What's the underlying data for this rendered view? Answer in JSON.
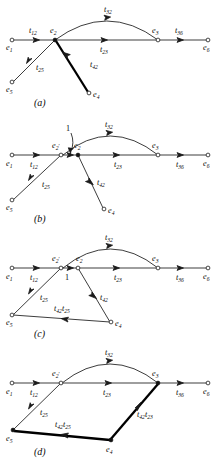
{
  "figure": {
    "panels": [
      {
        "id": "a",
        "caption": "(a)",
        "nodes": [
          {
            "name": "e1",
            "label": "e",
            "sub": "1"
          },
          {
            "name": "e2",
            "label": "e",
            "sub": "2"
          },
          {
            "name": "e3",
            "label": "e",
            "sub": "3"
          },
          {
            "name": "e4",
            "label": "e",
            "sub": "4"
          },
          {
            "name": "e5",
            "label": "e",
            "sub": "5"
          },
          {
            "name": "e6",
            "label": "e",
            "sub": "6"
          }
        ],
        "edges": [
          {
            "name": "e1-e2",
            "label": "t",
            "sub": "12",
            "bold": false
          },
          {
            "name": "e2-e3",
            "label": "t",
            "sub": "23",
            "bold": false
          },
          {
            "name": "e3-e6",
            "label": "t",
            "sub": "36",
            "bold": false
          },
          {
            "name": "e2-e3-arc",
            "label": "t",
            "sub": "32",
            "bold": false
          },
          {
            "name": "e2-e5",
            "label": "t",
            "sub": "25",
            "bold": false
          },
          {
            "name": "e4-e2",
            "label": "t",
            "sub": "42",
            "bold": true
          }
        ]
      },
      {
        "id": "b",
        "caption": "(b)",
        "nodes": [
          {
            "name": "e1",
            "label": "e",
            "sub": "1"
          },
          {
            "name": "e2prime",
            "label": "e",
            "sub": "2",
            "prime": "′"
          },
          {
            "name": "e2",
            "label": "e",
            "sub": "2"
          },
          {
            "name": "e3",
            "label": "e",
            "sub": "3"
          },
          {
            "name": "e4",
            "label": "e",
            "sub": "4"
          },
          {
            "name": "e5",
            "label": "e",
            "sub": "5"
          },
          {
            "name": "e6",
            "label": "e",
            "sub": "6"
          }
        ],
        "edges": [
          {
            "name": "e1-e2prime",
            "label": "t",
            "sub": "12",
            "bold": false
          },
          {
            "name": "e2prime-e2",
            "label": "1",
            "sub": "",
            "bold": false
          },
          {
            "name": "e2-e3",
            "label": "t",
            "sub": "23",
            "bold": false
          },
          {
            "name": "e3-e6",
            "label": "t",
            "sub": "36",
            "bold": false
          },
          {
            "name": "e2-e3-arc",
            "label": "t",
            "sub": "32",
            "bold": false
          },
          {
            "name": "e2prime-e5",
            "label": "t",
            "sub": "25",
            "bold": false
          },
          {
            "name": "e2-e4",
            "label": "t",
            "sub": "42",
            "bold": false
          }
        ]
      },
      {
        "id": "c",
        "caption": "(c)",
        "nodes": [
          {
            "name": "e1",
            "label": "e",
            "sub": "1"
          },
          {
            "name": "e2prime",
            "label": "e",
            "sub": "2",
            "prime": "′"
          },
          {
            "name": "e2",
            "label": "e",
            "sub": "2"
          },
          {
            "name": "e3",
            "label": "e",
            "sub": "3"
          },
          {
            "name": "e4",
            "label": "e",
            "sub": "4"
          },
          {
            "name": "e5",
            "label": "e",
            "sub": "5"
          },
          {
            "name": "e6",
            "label": "e",
            "sub": "6"
          }
        ],
        "edges": [
          {
            "name": "e1-e2prime",
            "label": "t",
            "sub": "12",
            "bold": false
          },
          {
            "name": "e2prime-e2",
            "label": "1",
            "sub": "",
            "bold": false
          },
          {
            "name": "e2-e3",
            "label": "t",
            "sub": "23",
            "bold": false
          },
          {
            "name": "e3-e6",
            "label": "t",
            "sub": "36",
            "bold": false
          },
          {
            "name": "e2-e3-arc",
            "label": "t",
            "sub": "32",
            "bold": false
          },
          {
            "name": "e2prime-e5",
            "label": "t",
            "sub": "25",
            "bold": false
          },
          {
            "name": "e2-e4",
            "label": "t",
            "sub": "42",
            "bold": false
          },
          {
            "name": "e4-e5",
            "label": "t",
            "sub": "42",
            "label2": "t",
            "sub2": "25",
            "bold": false
          }
        ]
      },
      {
        "id": "d",
        "caption": "(d)",
        "nodes": [
          {
            "name": "e1",
            "label": "e",
            "sub": "1"
          },
          {
            "name": "e2prime",
            "label": "e",
            "sub": "2",
            "prime": "′"
          },
          {
            "name": "e3",
            "label": "e",
            "sub": "3"
          },
          {
            "name": "e4",
            "label": "e",
            "sub": "4"
          },
          {
            "name": "e5",
            "label": "e",
            "sub": "5"
          },
          {
            "name": "e6",
            "label": "e",
            "sub": "6"
          }
        ],
        "edges": [
          {
            "name": "e1-e2prime",
            "label": "t",
            "sub": "12",
            "bold": false
          },
          {
            "name": "e2prime-e3",
            "label": "t",
            "sub": "23",
            "bold": false
          },
          {
            "name": "e3-e6",
            "label": "t",
            "sub": "36",
            "bold": false
          },
          {
            "name": "e2prime-e3-arc",
            "label": "t",
            "sub": "32",
            "bold": false
          },
          {
            "name": "e2prime-e5",
            "label": "t",
            "sub": "25",
            "bold": false
          },
          {
            "name": "e4-e5",
            "label": "t",
            "sub": "42",
            "label2": "t",
            "sub2": "25",
            "bold": true
          },
          {
            "name": "e4-e3",
            "label": "t",
            "sub": "42",
            "label2": "t",
            "sub2": "23",
            "bold": true
          }
        ]
      }
    ],
    "labels": {
      "e": "e",
      "t": "t",
      "one": "1",
      "prime": "′",
      "s1": "1",
      "s2": "2",
      "s3": "3",
      "s4": "4",
      "s5": "5",
      "s6": "6",
      "s12": "12",
      "s23": "23",
      "s25": "25",
      "s32": "32",
      "s36": "36",
      "s42": "42",
      "cap_a": "(a)",
      "cap_b": "(b)",
      "cap_c": "(c)",
      "cap_d": "(d)"
    }
  }
}
